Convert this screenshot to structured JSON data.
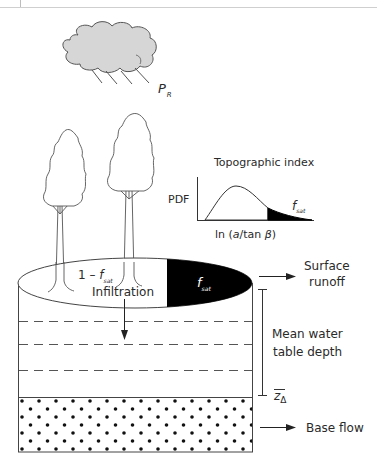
{
  "diagram": {
    "precipitation": {
      "symbol": "P",
      "subscript": "R"
    },
    "topographic_index": {
      "title": "Topographic index",
      "y_label": "PDF",
      "x_label_prefix": "ln (",
      "x_label_a": "a",
      "x_label_mid": "/tan ",
      "x_label_beta": "β",
      "x_label_suffix": ")",
      "tail_label": {
        "symbol": "f",
        "subscript": "sat"
      }
    },
    "surface": {
      "unsat_label": {
        "prefix": "1 – ",
        "symbol": "f",
        "subscript": "sat"
      },
      "sat_label": {
        "symbol": "f",
        "subscript": "sat"
      },
      "infiltration": "Infiltration"
    },
    "outputs": {
      "surface_runoff_line1": "Surface",
      "surface_runoff_line2": "runoff",
      "water_table_line1": "Mean water",
      "water_table_line2": "table depth",
      "z_symbol": "z",
      "z_subscript": "Δ",
      "base_flow": "Base flow"
    },
    "colors": {
      "line": "#3a3a3a",
      "cloud_fill": "#d6d6d6",
      "saturated_fill": "#000000",
      "dashed": "#555555"
    }
  }
}
